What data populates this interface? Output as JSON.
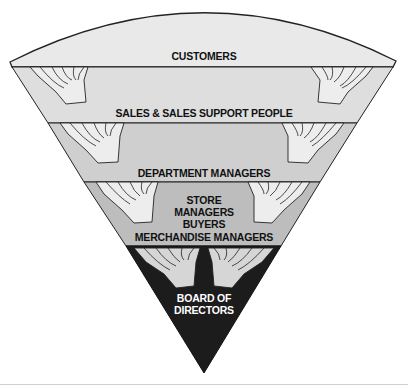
{
  "diagram": {
    "layers": [
      {
        "id": "customers",
        "lines": [
          "CUSTOMERS"
        ],
        "fill": "#e9e9e9",
        "text_color": "#111111"
      },
      {
        "id": "sales",
        "lines": [
          "SALES & SALES SUPPORT PEOPLE"
        ],
        "fill": "#dedede",
        "text_color": "#111111"
      },
      {
        "id": "department",
        "lines": [
          "DEPARTMENT MANAGERS"
        ],
        "fill": "#cfcfcf",
        "text_color": "#111111"
      },
      {
        "id": "store",
        "lines": [
          "STORE",
          "MANAGERS",
          "BUYERS",
          "MERCHANDISE MANAGERS"
        ],
        "fill": "#bdbdbd",
        "text_color": "#111111"
      },
      {
        "id": "board",
        "lines": [
          "BOARD OF",
          "DIRECTORS"
        ],
        "fill": "#1c1c1c",
        "text_color": "#ffffff"
      }
    ],
    "icons": [
      "supporting-hands-icon"
    ],
    "outline_color": "#222222"
  }
}
